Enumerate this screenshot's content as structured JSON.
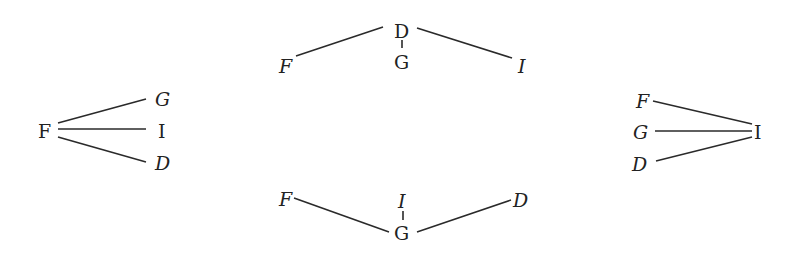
{
  "diagram": {
    "type": "tree-structures",
    "colors": {
      "ink": "#222222",
      "background": "#ffffff"
    },
    "trees": [
      {
        "id": "left",
        "root": {
          "label": "F",
          "italic": false
        },
        "children": [
          {
            "label": "G",
            "italic": true
          },
          {
            "label": "I",
            "italic": false
          },
          {
            "label": "D",
            "italic": true
          }
        ]
      },
      {
        "id": "top",
        "root": {
          "label": "D",
          "italic": false
        },
        "children": [
          {
            "label": "F",
            "italic": true
          },
          {
            "label": "G",
            "italic": false
          },
          {
            "label": "I",
            "italic": true
          }
        ]
      },
      {
        "id": "bottom",
        "root": {
          "label": "G",
          "italic": false
        },
        "children": [
          {
            "label": "F",
            "italic": true
          },
          {
            "label": "I",
            "italic": true
          },
          {
            "label": "D",
            "italic": true
          }
        ]
      },
      {
        "id": "right",
        "root": {
          "label": "I",
          "italic": false
        },
        "children": [
          {
            "label": "F",
            "italic": true
          },
          {
            "label": "G",
            "italic": true
          },
          {
            "label": "D",
            "italic": true
          }
        ]
      }
    ]
  }
}
